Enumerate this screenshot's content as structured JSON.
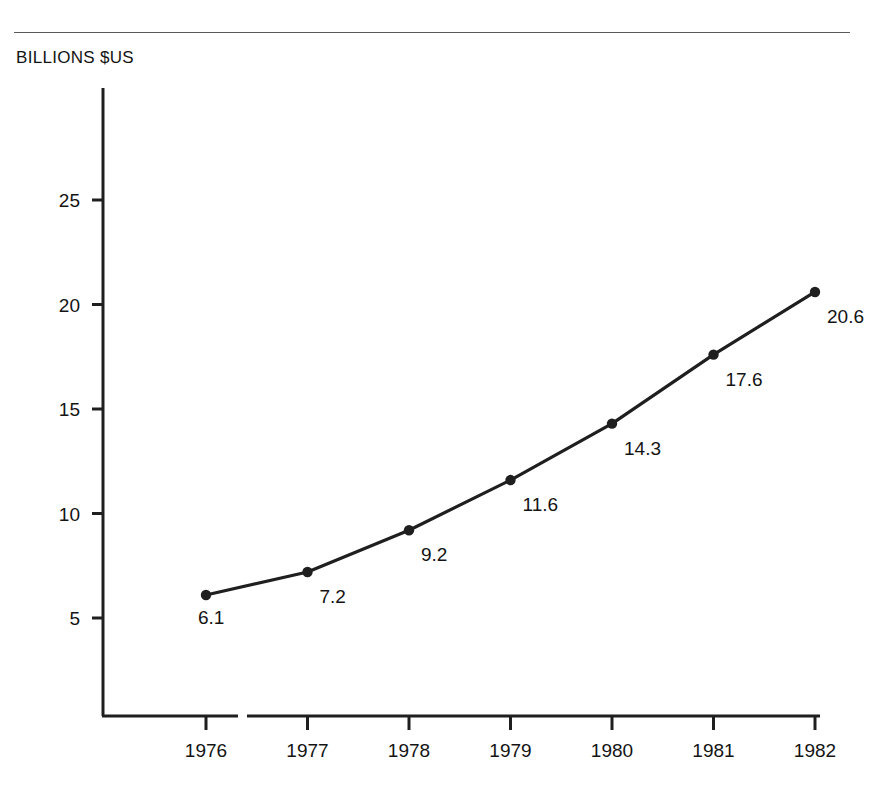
{
  "document": {
    "clipped_caption_fragment": "",
    "header_rule": "horizontal-rule"
  },
  "axis_unit_label": "BILLIONS $US",
  "chart_data": {
    "type": "line",
    "title": "",
    "subtitle": "",
    "xlabel": "",
    "ylabel": "BILLIONS $US",
    "categories": [
      "1976",
      "1977",
      "1978",
      "1979",
      "1980",
      "1981",
      "1982"
    ],
    "x": [
      1976,
      1977,
      1978,
      1979,
      1980,
      1981,
      1982
    ],
    "values": [
      6.1,
      7.2,
      9.2,
      11.6,
      14.3,
      17.6,
      20.6
    ],
    "point_labels": [
      "6.1",
      "7.2",
      "9.2",
      "11.6",
      "14.3",
      "17.6",
      "20.6"
    ],
    "ylim": [
      0,
      28
    ],
    "xlim": [
      1975.6,
      1982.2
    ],
    "yticks": [
      5,
      10,
      15,
      20,
      25
    ],
    "ytick_labels": [
      "5",
      "10",
      "15",
      "20",
      "25"
    ],
    "xtick_labels": [
      "1976",
      "1977",
      "1978",
      "1979",
      "1980",
      "1981",
      "1982"
    ],
    "grid": false,
    "legend": null,
    "legend_position": "none",
    "markers": "filled-circle",
    "series": [
      {
        "name": "",
        "values": [
          6.1,
          7.2,
          9.2,
          11.6,
          14.3,
          17.6,
          20.6
        ]
      }
    ],
    "colors": {
      "line": "#1f1f1f",
      "marker": "#1f1f1f",
      "axis": "#1f1f1f",
      "text": "#141414",
      "background": "#ffffff",
      "rule": "#5a5a5a"
    }
  }
}
